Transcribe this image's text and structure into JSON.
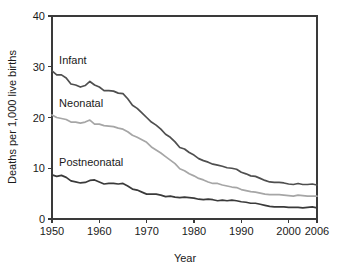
{
  "chart_data": {
    "type": "line",
    "title": "",
    "xlabel": "Year",
    "ylabel": "Deaths per 1,000 live births",
    "xlim": [
      1950,
      2006
    ],
    "ylim": [
      0,
      40
    ],
    "grid": false,
    "legend_position": "inline-series-labels",
    "x_ticks": [
      1950,
      1960,
      1970,
      1980,
      1990,
      2000,
      2006
    ],
    "x_tick_labels": [
      "1950",
      "1960",
      "1970",
      "1980",
      "1990",
      "2000",
      "2006"
    ],
    "y_ticks": [
      0,
      10,
      20,
      30,
      40
    ],
    "y_tick_labels": [
      "0",
      "10",
      "20",
      "30",
      "40"
    ],
    "x": [
      1950,
      1951,
      1952,
      1953,
      1954,
      1955,
      1956,
      1957,
      1958,
      1959,
      1960,
      1961,
      1962,
      1963,
      1964,
      1965,
      1966,
      1967,
      1968,
      1969,
      1970,
      1971,
      1972,
      1973,
      1974,
      1975,
      1976,
      1977,
      1978,
      1979,
      1980,
      1981,
      1982,
      1983,
      1984,
      1985,
      1986,
      1987,
      1988,
      1989,
      1990,
      1991,
      1992,
      1993,
      1994,
      1995,
      1996,
      1997,
      1998,
      1999,
      2000,
      2001,
      2002,
      2003,
      2004,
      2005,
      2006
    ],
    "series": [
      {
        "name": "Infant",
        "color": "#4f4f4f",
        "values": [
          29.2,
          28.4,
          28.4,
          27.8,
          26.6,
          26.4,
          26.0,
          26.3,
          27.1,
          26.4,
          26.0,
          25.3,
          25.3,
          25.2,
          24.8,
          24.7,
          23.7,
          22.4,
          21.8,
          20.9,
          20.0,
          19.1,
          18.5,
          17.7,
          16.7,
          16.1,
          15.2,
          14.1,
          13.8,
          13.1,
          12.6,
          11.9,
          11.5,
          11.2,
          10.8,
          10.6,
          10.4,
          10.1,
          10.0,
          9.8,
          9.2,
          8.9,
          8.5,
          8.4,
          8.0,
          7.6,
          7.3,
          7.2,
          7.2,
          7.1,
          6.9,
          6.8,
          7.0,
          6.8,
          6.8,
          6.9,
          6.7
        ]
      },
      {
        "name": "Neonatal",
        "color": "#a6a6a6",
        "values": [
          20.5,
          20.0,
          19.8,
          19.6,
          19.1,
          19.1,
          18.9,
          19.1,
          19.5,
          18.7,
          18.7,
          18.4,
          18.3,
          18.2,
          17.9,
          17.7,
          17.2,
          16.5,
          16.1,
          15.6,
          15.1,
          14.2,
          13.6,
          13.0,
          12.3,
          11.6,
          10.9,
          9.9,
          9.5,
          8.9,
          8.5,
          8.0,
          7.7,
          7.3,
          7.0,
          7.0,
          6.7,
          6.5,
          6.3,
          6.2,
          5.8,
          5.6,
          5.4,
          5.3,
          5.1,
          4.9,
          4.8,
          4.8,
          4.8,
          4.7,
          4.6,
          4.5,
          4.7,
          4.6,
          4.5,
          4.5,
          4.5
        ]
      },
      {
        "name": "Postneonatal",
        "color": "#3a3a3a",
        "values": [
          8.7,
          8.4,
          8.6,
          8.2,
          7.5,
          7.3,
          7.1,
          7.2,
          7.6,
          7.7,
          7.3,
          6.9,
          7.0,
          7.0,
          6.9,
          7.0,
          6.5,
          5.9,
          5.7,
          5.3,
          4.9,
          4.9,
          4.9,
          4.7,
          4.4,
          4.5,
          4.3,
          4.2,
          4.3,
          4.2,
          4.1,
          3.9,
          3.8,
          3.9,
          3.8,
          3.6,
          3.7,
          3.6,
          3.7,
          3.6,
          3.4,
          3.3,
          3.1,
          3.1,
          2.9,
          2.7,
          2.5,
          2.4,
          2.4,
          2.4,
          2.3,
          2.3,
          2.3,
          2.2,
          2.3,
          2.4,
          2.2
        ]
      }
    ],
    "annotations": [
      {
        "text": "Infant",
        "x": 1951.5,
        "y": 30.6
      },
      {
        "text": "Neonatal",
        "x": 1951.5,
        "y": 22.1
      },
      {
        "text": "Postneonatal",
        "x": 1951.5,
        "y": 10.4
      }
    ]
  }
}
